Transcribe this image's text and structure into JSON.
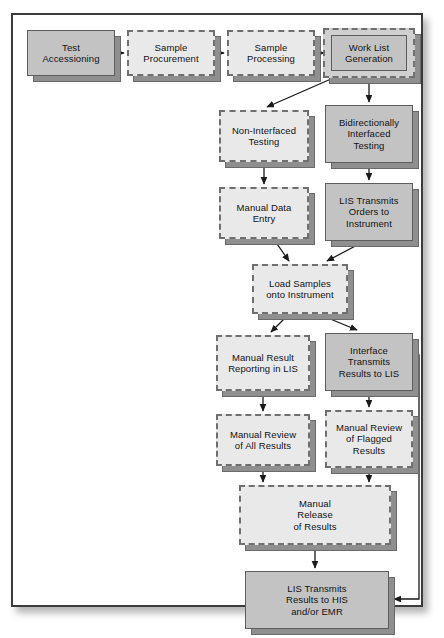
{
  "diagram": {
    "frame": {
      "x": 11,
      "y": 13,
      "w": 412,
      "h": 594
    },
    "style_legend": {
      "solid_fill": "#c3c3c3",
      "dashed_fill": "#e9e9e9",
      "shadow": "#8f8f8f",
      "border_solid": "#5d5d5d",
      "border_dashed": "#6f6f6f",
      "edge_color": "#1a1a1a",
      "frame_border": "#3b3b3b"
    },
    "nodes": [
      {
        "id": "test-accessioning",
        "label": "Test\nAccessioning",
        "style": "solid",
        "x": 14,
        "y": 15,
        "w": 88,
        "h": 46
      },
      {
        "id": "sample-procurement",
        "label": "Sample\nProcurement",
        "style": "dashed",
        "x": 114,
        "y": 15,
        "w": 88,
        "h": 46
      },
      {
        "id": "sample-processing",
        "label": "Sample\nProcessing",
        "style": "dashed",
        "x": 214,
        "y": 15,
        "w": 88,
        "h": 46
      },
      {
        "id": "work-list-generation",
        "label": "Work List\nGeneration",
        "style": "nested",
        "x": 310,
        "y": 13,
        "w": 92,
        "h": 50
      },
      {
        "id": "non-interfaced-testing",
        "label": "Non-Interfaced\nTesting",
        "style": "dashed",
        "x": 206,
        "y": 95,
        "w": 90,
        "h": 52
      },
      {
        "id": "bidirectional-testing",
        "label": "Bidirectionally\nInterfaced\nTesting",
        "style": "solid",
        "x": 312,
        "y": 90,
        "w": 88,
        "h": 58
      },
      {
        "id": "manual-data-entry",
        "label": "Manual Data\nEntry",
        "style": "dashed",
        "x": 206,
        "y": 172,
        "w": 90,
        "h": 52
      },
      {
        "id": "lis-transmits-orders",
        "label": "LIS Transmits\nOrders to\nInstrument",
        "style": "solid",
        "x": 312,
        "y": 168,
        "w": 88,
        "h": 58
      },
      {
        "id": "load-samples",
        "label": "Load Samples\nonto Instrument",
        "style": "dashed",
        "x": 239,
        "y": 249,
        "w": 96,
        "h": 50
      },
      {
        "id": "manual-result-reporting",
        "label": "Manual Result\nReporting in LIS",
        "style": "dashed",
        "x": 203,
        "y": 320,
        "w": 94,
        "h": 56
      },
      {
        "id": "interface-transmits",
        "label": "Interface\nTransmits\nResults to LIS",
        "style": "solid",
        "x": 312,
        "y": 318,
        "w": 88,
        "h": 58
      },
      {
        "id": "manual-review-all",
        "label": "Manual Review\nof All Results",
        "style": "dashed",
        "x": 203,
        "y": 399,
        "w": 94,
        "h": 52
      },
      {
        "id": "manual-review-flagged",
        "label": "Manual Review\nof Flagged\nResults",
        "style": "dashed",
        "x": 312,
        "y": 395,
        "w": 88,
        "h": 58
      },
      {
        "id": "manual-release",
        "label": "Manual\nRelease\nof Results",
        "style": "dashed",
        "x": 226,
        "y": 470,
        "w": 152,
        "h": 60
      },
      {
        "id": "lis-transmits-results",
        "label": "LIS Transmits\nResults to HIS\nand/or EMR",
        "style": "solid",
        "x": 232,
        "y": 556,
        "w": 144,
        "h": 58
      }
    ],
    "edges": [
      {
        "id": "e-accession-procurement",
        "from": "test-accessioning",
        "to": "sample-procurement",
        "kind": "straight"
      },
      {
        "id": "e-procurement-processing",
        "from": "sample-procurement",
        "to": "sample-processing",
        "kind": "straight"
      },
      {
        "id": "e-processing-worklist",
        "from": "sample-processing",
        "to": "work-list-generation",
        "kind": "straight"
      },
      {
        "id": "e-worklist-noninterfaced",
        "from": "work-list-generation",
        "to": "non-interfaced-testing",
        "kind": "diagonal"
      },
      {
        "id": "e-worklist-bidirectional",
        "from": "work-list-generation",
        "to": "bidirectional-testing",
        "kind": "straight"
      },
      {
        "id": "e-noninterfaced-manualentry",
        "from": "non-interfaced-testing",
        "to": "manual-data-entry",
        "kind": "straight"
      },
      {
        "id": "e-bidirectional-lisorders",
        "from": "bidirectional-testing",
        "to": "lis-transmits-orders",
        "kind": "straight"
      },
      {
        "id": "e-manualentry-loadsamples",
        "from": "manual-data-entry",
        "to": "load-samples",
        "kind": "diagonal"
      },
      {
        "id": "e-lisorders-loadsamples",
        "from": "lis-transmits-orders",
        "to": "load-samples",
        "kind": "diagonal"
      },
      {
        "id": "e-loadsamples-manualresult",
        "from": "load-samples",
        "to": "manual-result-reporting",
        "kind": "diagonal"
      },
      {
        "id": "e-loadsamples-interface",
        "from": "load-samples",
        "to": "interface-transmits",
        "kind": "diagonal"
      },
      {
        "id": "e-manualresult-reviewall",
        "from": "manual-result-reporting",
        "to": "manual-review-all",
        "kind": "straight"
      },
      {
        "id": "e-interface-reviewflagged",
        "from": "interface-transmits",
        "to": "manual-review-flagged",
        "kind": "straight"
      },
      {
        "id": "e-reviewall-release",
        "from": "manual-review-all",
        "to": "manual-release",
        "kind": "straight"
      },
      {
        "id": "e-reviewflagged-release",
        "from": "manual-review-flagged",
        "to": "manual-release",
        "kind": "straight"
      },
      {
        "id": "e-release-listransmits",
        "from": "manual-release",
        "to": "lis-transmits-results",
        "kind": "straight"
      },
      {
        "id": "e-interface-bypass",
        "from": "interface-transmits",
        "to": "lis-transmits-results",
        "kind": "orthogonal-bypass"
      }
    ]
  }
}
